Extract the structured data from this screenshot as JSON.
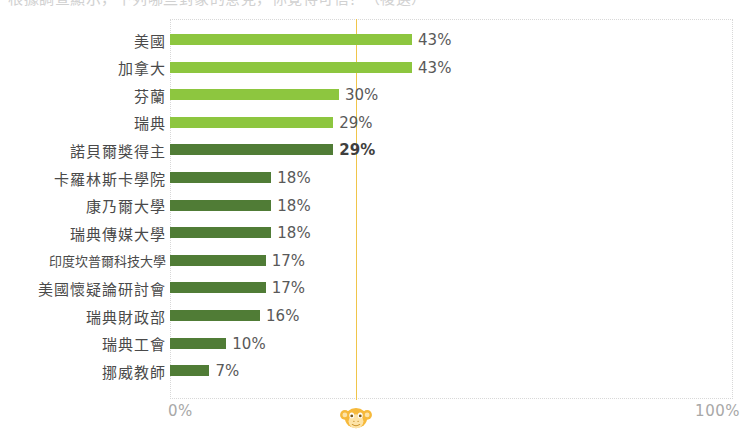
{
  "top_partial_text": "根據調查顯示，下列哪些對象的意見，你覺得可信？（複選）",
  "colors": {
    "bar_light": "#8dc63f",
    "bar_dark": "#507c36",
    "reference_line": "#f0c54a",
    "watermark": "#f5b731",
    "label_text": "#4a4a4a",
    "axis_text": "#a8a8a8",
    "plot_border": "#d8d8d8"
  },
  "axis": {
    "min_label": "0%",
    "max_label": "100%",
    "min_value": 0,
    "max_value": 100
  },
  "reference_line": {
    "value": 33,
    "visible": true
  },
  "watermark": {
    "name": "monkey-logo",
    "value": 33
  },
  "chart_data": {
    "type": "bar",
    "orientation": "horizontal",
    "title": "",
    "xlabel": "",
    "ylabel": "",
    "xlim": [
      0,
      100
    ],
    "grid": false,
    "legend": "none",
    "value_suffix": "%",
    "categories": [
      "美國",
      "加拿大",
      "芬蘭",
      "瑞典",
      "諾貝爾獎得主",
      "卡羅林斯卡學院",
      "康乃爾大學",
      "瑞典傳媒大學",
      "印度坎普爾科技大學",
      "美國懷疑論研討會",
      "瑞典財政部",
      "瑞典工會",
      "挪威教師"
    ],
    "values": [
      43,
      43,
      30,
      29,
      29,
      18,
      18,
      18,
      17,
      17,
      16,
      10,
      7
    ],
    "data_labels": [
      "43%",
      "43%",
      "30%",
      "29%",
      "29%",
      "18%",
      "18%",
      "18%",
      "17%",
      "17%",
      "16%",
      "10%",
      "7%"
    ],
    "bar_styles": [
      "light",
      "light",
      "light",
      "light",
      "dark",
      "dark",
      "dark",
      "dark",
      "dark",
      "dark",
      "dark",
      "dark",
      "dark"
    ],
    "emphasized_index": 4
  }
}
